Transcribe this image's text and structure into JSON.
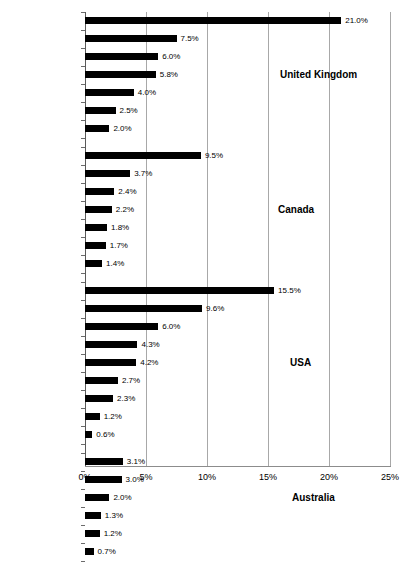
{
  "chart_data": {
    "type": "bar",
    "orientation": "horizontal",
    "title": "",
    "subtitle": "",
    "xlabel": "",
    "ylabel": "",
    "xlim": [
      0,
      25
    ],
    "xtick_values": [
      0,
      5,
      10,
      15,
      20,
      25
    ],
    "xtick_labels": [
      "0%",
      "5%",
      "10%",
      "15%",
      "20%",
      "25%"
    ],
    "grid": true,
    "grid_axis": "x",
    "legend": "none",
    "value_label_suffix": "%",
    "bar_color": "#000000",
    "groups": [
      {
        "name": "United Kingdom",
        "categories": [
          "Cambridge",
          "Oxfordshire",
          "Petersborough",
          "Norfolk",
          "Exeter",
          "Northampton",
          "London"
        ],
        "values": [
          21.0,
          7.5,
          6.0,
          5.8,
          4.0,
          2.5,
          2.0
        ],
        "value_labels": [
          "21.0%",
          "7.5%",
          "6.0%",
          "5.8%",
          "4.0%",
          "2.5%",
          "2.0%"
        ]
      },
      {
        "name": "Canada",
        "categories": [
          "Victoria",
          "Vancouver",
          "Montreal",
          "Ottawa",
          "Winnipeg",
          "Toronto",
          "Calgary"
        ],
        "values": [
          9.5,
          3.7,
          2.4,
          2.2,
          1.8,
          1.7,
          1.4
        ],
        "value_labels": [
          "9.5%",
          "3.7%",
          "2.4%",
          "2.2%",
          "1.8%",
          "1.7%",
          "1.4%"
        ]
      },
      {
        "name": "USA",
        "categories": [
          "Davis",
          "Boulder",
          "Portland",
          "Minneapolis",
          "Madison",
          "San Francisco",
          "Washington",
          "Chicago",
          "New York"
        ],
        "values": [
          15.5,
          9.6,
          6.0,
          4.3,
          4.2,
          2.7,
          2.3,
          1.2,
          0.6
        ],
        "value_labels": [
          "15.5%",
          "9.6%",
          "6.0%",
          "4.3%",
          "4.2%",
          "2.7%",
          "2.3%",
          "1.2%",
          "0.6%"
        ]
      },
      {
        "name": "Australia",
        "categories": [
          "Canberra",
          "Perth",
          "Brisbane",
          "Melbourne",
          "Adelaide",
          "Sydney"
        ],
        "values": [
          3.1,
          3.0,
          2.0,
          1.3,
          1.2,
          0.7
        ],
        "value_labels": [
          "3.1%",
          "3.0%",
          "2.0%",
          "1.3%",
          "1.2%",
          "0.7%"
        ]
      }
    ]
  }
}
